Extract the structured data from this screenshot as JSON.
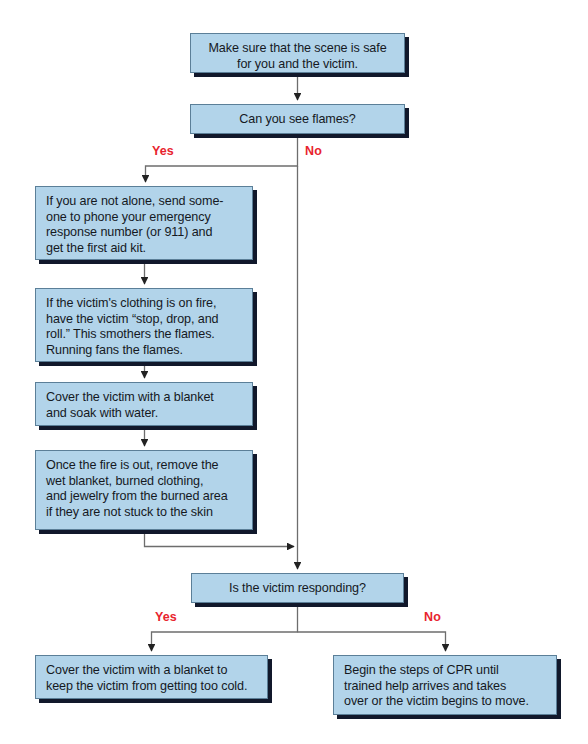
{
  "diagram": {
    "background_color": "#ffffff",
    "node_fill_color": "#b2d4ea",
    "node_border_color": "#5b7f98",
    "node_shadow_color": "#11182b",
    "connector_color": "#6d6d6d",
    "branch_label_color": "#e8242e",
    "nodes": {
      "scene_safe": "Make sure that the scene is safe\nfor you and the victim.",
      "flames_question": "Can you see flames?",
      "call_help": "If you are not alone, send some-\none to phone your emergency\nresponse number (or 911) and\nget the first aid kit.",
      "stop_drop_roll": "If the victim's clothing is on fire,\nhave the victim “stop, drop, and\nroll.” This smothers the flames.\nRunning fans the flames.",
      "blanket_water": "Cover the victim with a blanket\nand soak with water.",
      "remove_clothing": "Once the fire is out, remove the\nwet blanket, burned clothing,\nand jewelry from the burned area\nif they are not stuck to the skin",
      "responding_question": "Is the victim responding?",
      "keep_warm": "Cover the victim with a blanket to\nkeep the victim from getting too cold.",
      "begin_cpr": "Begin the steps of CPR until\ntrained help arrives and takes\nover or the victim begins to move."
    },
    "branch_labels": {
      "flames_yes": "Yes",
      "flames_no": "No",
      "responding_yes": "Yes",
      "responding_no": "No"
    }
  }
}
